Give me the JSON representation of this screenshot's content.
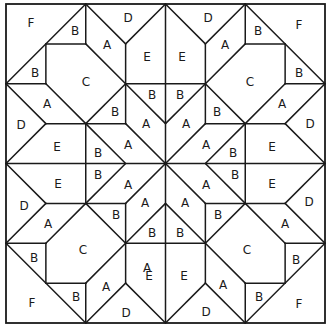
{
  "diagram": {
    "kind": "quilt-block-pattern",
    "colors": {
      "line": "#1a1a1a",
      "background": "#ffffff"
    },
    "piece_labels": {
      "top_left": [
        {
          "t": "F",
          "x": 31,
          "y": 23
        },
        {
          "t": "B",
          "x": 75,
          "y": 31
        },
        {
          "t": "D",
          "x": 128,
          "y": 18
        },
        {
          "t": "A",
          "x": 107,
          "y": 45
        },
        {
          "t": "E",
          "x": 147,
          "y": 57
        },
        {
          "t": "B",
          "x": 35,
          "y": 73
        },
        {
          "t": "C",
          "x": 86,
          "y": 82
        },
        {
          "t": "A",
          "x": 47,
          "y": 104
        },
        {
          "t": "D",
          "x": 21,
          "y": 125
        },
        {
          "t": "E",
          "x": 57,
          "y": 147
        },
        {
          "t": "B",
          "x": 115,
          "y": 112
        },
        {
          "t": "B",
          "x": 152,
          "y": 95
        },
        {
          "t": "A",
          "x": 146,
          "y": 124
        },
        {
          "t": "A",
          "x": 128,
          "y": 145
        },
        {
          "t": "B",
          "x": 98,
          "y": 153
        }
      ],
      "top_right": [
        {
          "t": "D",
          "x": 208,
          "y": 18
        },
        {
          "t": "F",
          "x": 299,
          "y": 25
        },
        {
          "t": "B",
          "x": 258,
          "y": 31
        },
        {
          "t": "E",
          "x": 182,
          "y": 57
        },
        {
          "t": "A",
          "x": 225,
          "y": 45
        },
        {
          "t": "B",
          "x": 299,
          "y": 73
        },
        {
          "t": "C",
          "x": 250,
          "y": 82
        },
        {
          "t": "B",
          "x": 180,
          "y": 95
        },
        {
          "t": "B",
          "x": 217,
          "y": 112
        },
        {
          "t": "A",
          "x": 282,
          "y": 104
        },
        {
          "t": "D",
          "x": 310,
          "y": 124
        },
        {
          "t": "A",
          "x": 186,
          "y": 124
        },
        {
          "t": "A",
          "x": 206,
          "y": 145
        },
        {
          "t": "B",
          "x": 233,
          "y": 153
        },
        {
          "t": "E",
          "x": 272,
          "y": 147
        }
      ],
      "bottom_left": [
        {
          "t": "E",
          "x": 58,
          "y": 184
        },
        {
          "t": "B",
          "x": 98,
          "y": 175
        },
        {
          "t": "A",
          "x": 128,
          "y": 185
        },
        {
          "t": "D",
          "x": 24,
          "y": 206
        },
        {
          "t": "A",
          "x": 145,
          "y": 203
        },
        {
          "t": "A",
          "x": 48,
          "y": 224
        },
        {
          "t": "B",
          "x": 116,
          "y": 215
        },
        {
          "t": "B",
          "x": 152,
          "y": 233
        },
        {
          "t": "C",
          "x": 83,
          "y": 250
        },
        {
          "t": "B",
          "x": 34,
          "y": 258
        },
        {
          "t": "A",
          "x": 147,
          "y": 268
        },
        {
          "t": "E",
          "x": 149,
          "y": 276
        },
        {
          "t": "F",
          "x": 32,
          "y": 303
        },
        {
          "t": "B",
          "x": 76,
          "y": 297
        },
        {
          "t": "A",
          "x": 106,
          "y": 287
        },
        {
          "t": "D",
          "x": 126,
          "y": 313
        }
      ],
      "bottom_right": [
        {
          "t": "E",
          "x": 272,
          "y": 184
        },
        {
          "t": "B",
          "x": 235,
          "y": 175
        },
        {
          "t": "A",
          "x": 206,
          "y": 185
        },
        {
          "t": "D",
          "x": 309,
          "y": 202
        },
        {
          "t": "A",
          "x": 185,
          "y": 203
        },
        {
          "t": "A",
          "x": 285,
          "y": 224
        },
        {
          "t": "B",
          "x": 218,
          "y": 215
        },
        {
          "t": "B",
          "x": 180,
          "y": 233
        },
        {
          "t": "C",
          "x": 247,
          "y": 250
        },
        {
          "t": "B",
          "x": 296,
          "y": 260
        },
        {
          "t": "E",
          "x": 184,
          "y": 276
        },
        {
          "t": "A",
          "x": 223,
          "y": 285
        },
        {
          "t": "B",
          "x": 259,
          "y": 297
        },
        {
          "t": "F",
          "x": 299,
          "y": 304
        },
        {
          "t": "D",
          "x": 206,
          "y": 312
        }
      ]
    }
  }
}
